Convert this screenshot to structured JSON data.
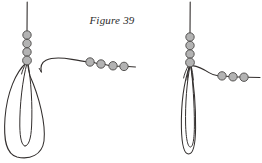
{
  "figure": {
    "caption": "Figure 39",
    "background_color": "#ffffff",
    "line_color": "#332f2e",
    "bead_fill_color": "#b3b3b3",
    "bead_stroke_color": "#4a4746",
    "caption_color": "#2b2b2b"
  },
  "diagrams": [
    {
      "id": "left-diagram",
      "name": "left-knot-diagram",
      "description": "Vertical beaded strand descending into a long narrow loop, with a separate beaded working end running to the right",
      "vertical_strand": {
        "top_x": 27,
        "top_y": 2,
        "bottom_y": 62,
        "bead_count": 4,
        "bead_radius": 4.2,
        "beads": [
          {
            "cx": 27,
            "cy": 35
          },
          {
            "cx": 27,
            "cy": 43
          },
          {
            "cx": 27,
            "cy": 51
          },
          {
            "cx": 27,
            "cy": 60
          }
        ]
      },
      "loop": {
        "type": "elongated-double-loop",
        "apex_x": 27,
        "apex_y": 63,
        "outer_left_x": 5,
        "outer_bottom_y": 158,
        "inner_left_x": 19,
        "inner_right_x": 31,
        "inner_bottom_y": 146
      },
      "working_end": {
        "start_x": 41,
        "start_y": 71,
        "bead_count": 4,
        "bead_radius": 4.2,
        "beads": [
          {
            "cx": 90,
            "cy": 62
          },
          {
            "cx": 101,
            "cy": 64
          },
          {
            "cx": 113,
            "cy": 66
          },
          {
            "cx": 124,
            "cy": 66
          }
        ],
        "tail_end_x": 135,
        "tail_end_y": 67
      }
    },
    {
      "id": "right-diagram",
      "name": "right-knot-diagram",
      "description": "Vertical beaded strand drawn down through a tightened narrow loop, with the beaded working end pulled to the right",
      "vertical_strand": {
        "top_x": 190,
        "top_y": 2,
        "bottom_y": 62,
        "bead_count": 4,
        "bead_radius": 4.2,
        "beads": [
          {
            "cx": 190,
            "cy": 37
          },
          {
            "cx": 190,
            "cy": 45
          },
          {
            "cx": 190,
            "cy": 53
          },
          {
            "cx": 190,
            "cy": 62
          }
        ]
      },
      "loop": {
        "type": "elongated-double-loop",
        "apex_x": 190,
        "apex_y": 65,
        "outer_left_x": 180,
        "outer_bottom_y": 155,
        "inner_left_x": 186,
        "inner_right_x": 195,
        "inner_bottom_y": 148
      },
      "working_end": {
        "start_x": 193,
        "start_y": 67,
        "bead_count": 3,
        "bead_radius": 4.2,
        "beads": [
          {
            "cx": 222,
            "cy": 76
          },
          {
            "cx": 233,
            "cy": 77
          },
          {
            "cx": 244,
            "cy": 77
          }
        ],
        "tail_end_x": 260,
        "tail_end_y": 77
      }
    }
  ]
}
